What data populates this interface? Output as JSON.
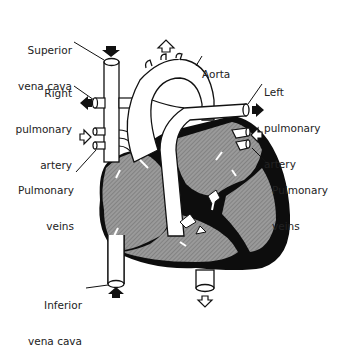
{
  "diagram": {
    "colors": {
      "background": "#ffffff",
      "outline": "#111111",
      "chamber_fill": "#8a8a8a",
      "muscle": "#0d0d0d",
      "vessel_fill": "#ffffff"
    },
    "labels": {
      "superior_vena_cava": {
        "line1": "Superior",
        "line2": "vena cava"
      },
      "right_pulmonary_artery": {
        "line1": "Right",
        "line2": "pulmonary",
        "line3": "artery"
      },
      "pulmonary_veins_right": {
        "line1": "Pulmonary",
        "line2": "veins"
      },
      "inferior_vena_cava": {
        "line1": "Inferior",
        "line2": "vena cava"
      },
      "aorta": {
        "line1": "Aorta"
      },
      "left_pulmonary_artery": {
        "line1": "Left",
        "line2": "pulmonary",
        "line3": "artery"
      },
      "pulmonary_veins_left": {
        "line1": "Pulmonary",
        "line2": "veins"
      }
    },
    "flow_arrows": [
      {
        "id": "svc-in",
        "direction": "down",
        "style": "filled"
      },
      {
        "id": "aorta-out",
        "direction": "up",
        "style": "open"
      },
      {
        "id": "rpa-out",
        "direction": "left",
        "style": "filled"
      },
      {
        "id": "rpv-in",
        "direction": "right",
        "style": "open"
      },
      {
        "id": "lpa-out",
        "direction": "right",
        "style": "filled"
      },
      {
        "id": "lpv-in",
        "direction": "left",
        "style": "open"
      },
      {
        "id": "ivc-in",
        "direction": "up",
        "style": "filled"
      },
      {
        "id": "descending-aorta-out",
        "direction": "down",
        "style": "open"
      }
    ]
  }
}
